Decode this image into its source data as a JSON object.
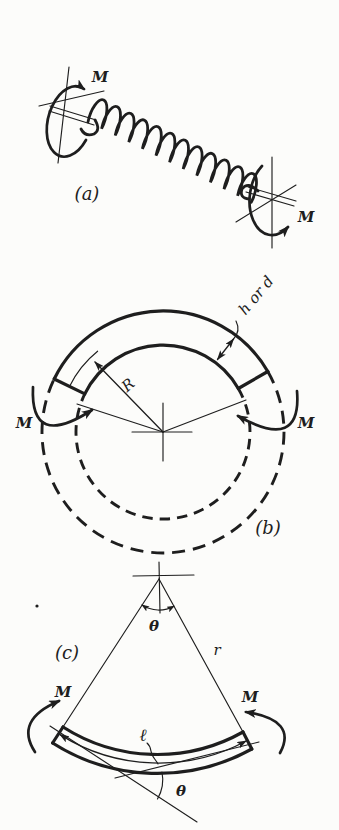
{
  "ink_color": "#1e1e1e",
  "paper_color": "#fcfcfa",
  "figure_a": {
    "caption": "(a)",
    "moment_label_left": "M",
    "moment_label_right": "M"
  },
  "figure_b": {
    "caption": "(b)",
    "moment_label_left": "M",
    "moment_label_right": "M",
    "radius_label": "R",
    "section_label": "h or d"
  },
  "figure_c": {
    "caption": "(c)",
    "moment_label_left": "M",
    "moment_label_right": "M",
    "apex_angle_label": "θ",
    "radius_label": "r",
    "arc_length_label": "ℓ",
    "deflection_angle_label": "θ"
  }
}
